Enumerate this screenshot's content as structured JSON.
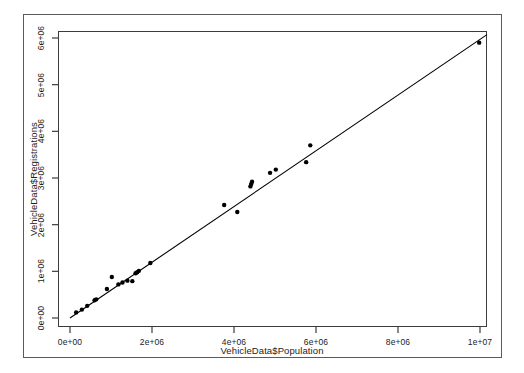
{
  "figure": {
    "background": "#ffffff",
    "frame_color": "#5a5a5a",
    "plot_border_color": "#3c3c3c"
  },
  "axis_titles": {
    "x": "VehicleData$Population",
    "y": "VehicleData$Registrations"
  },
  "chart_data": {
    "type": "scatter",
    "title": "",
    "subtitle": "",
    "xlabel": "VehicleData$Population",
    "ylabel": "VehicleData$Registrations",
    "xlim": [
      -300000,
      10200000
    ],
    "ylim": [
      -150000,
      6250000
    ],
    "xticks": [
      0,
      2000000,
      4000000,
      6000000,
      8000000,
      10000000
    ],
    "xtick_labels": [
      "0e+00",
      "2e+06",
      "4e+06",
      "6e+06",
      "8e+06",
      "1e+07"
    ],
    "yticks": [
      0,
      1000000,
      2000000,
      3000000,
      4000000,
      5000000,
      6000000
    ],
    "ytick_labels": [
      "0e+00",
      "1e+06",
      "2e+06",
      "3e+06",
      "4e+06",
      "5e+06",
      "6e+06"
    ],
    "grid": false,
    "legend": false,
    "point_color": "#000000",
    "point_size": 3.2,
    "series": [
      {
        "name": "Registrations vs Population",
        "x": [
          150000,
          290000,
          420000,
          600000,
          640000,
          900000,
          1020000,
          1180000,
          1280000,
          1400000,
          1520000,
          1600000,
          1640000,
          1680000,
          1960000,
          3760000,
          4080000,
          4400000,
          4420000,
          4440000,
          4880000,
          5020000,
          5760000,
          5860000,
          9980000
        ],
        "y": [
          120000,
          180000,
          260000,
          380000,
          400000,
          620000,
          880000,
          720000,
          760000,
          800000,
          790000,
          960000,
          980000,
          1010000,
          1180000,
          2420000,
          2270000,
          2820000,
          2870000,
          2920000,
          3110000,
          3180000,
          3340000,
          3700000,
          5900000
        ]
      }
    ],
    "fit_line": {
      "type": "linear",
      "visible": true,
      "color": "#000000",
      "width": 1.1,
      "x_start": 0,
      "y_start": 0,
      "x_end": 10250000,
      "y_end": 6120000
    }
  }
}
